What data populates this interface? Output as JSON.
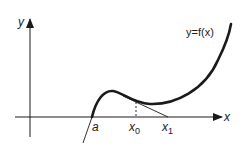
{
  "diagram": {
    "axes": {
      "x_label": "x",
      "y_label": "y"
    },
    "curve_label": "y=f(x)",
    "points": {
      "root_label": "a",
      "x0_label": "x",
      "x0_sub": "0",
      "x1_label": "x",
      "x1_sub": "1"
    },
    "colors": {
      "ink": "#1a1a1a",
      "background": "#ffffff"
    }
  }
}
